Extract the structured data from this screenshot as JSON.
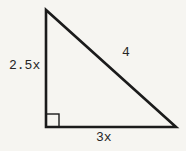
{
  "diagram": {
    "type": "right-triangle",
    "sides": {
      "left_label": "2.5x",
      "hypotenuse_label": "4",
      "base_label": "3x"
    },
    "right_angle_marker_position": "bottom-left",
    "colors": {
      "background": "#f6f5f1",
      "line": "#1b1b1b",
      "text": "#252525"
    }
  }
}
